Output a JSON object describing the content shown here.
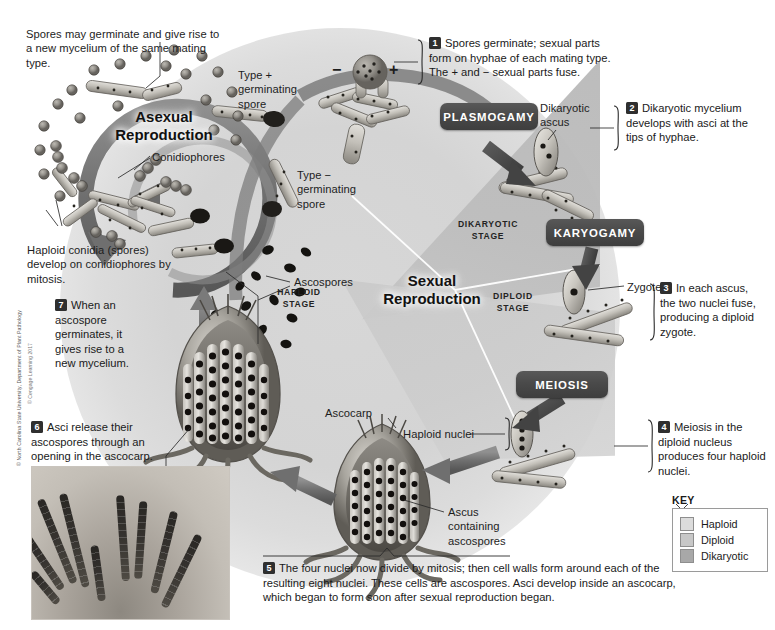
{
  "figure": {
    "asexual_cycle_label": "Asexual\nReproduction",
    "asexual_cycle_line1": "Asexual",
    "asexual_cycle_line2": "Reproduction",
    "sexual_cycle_line1": "Sexual",
    "sexual_cycle_line2": "Reproduction",
    "figure_credit": "© Cengage Learning 2017",
    "photo_credit": "© North Carolina State University, Department of Plant Pathology"
  },
  "stage_labels": {
    "haploid_line1": "HAPLOID",
    "haploid_line2": "STAGE",
    "dikaryotic_line1": "DIKARYOTIC",
    "dikaryotic_line2": "STAGE",
    "diploid_line1": "DIPLOID",
    "diploid_line2": "STAGE"
  },
  "process_boxes": [
    {
      "id": "plasmogamy",
      "label": "PLASMOGAMY"
    },
    {
      "id": "karyogamy",
      "label": "KARYOGAMY"
    },
    {
      "id": "meiosis",
      "label": "MEIOSIS"
    }
  ],
  "numbered_steps": [
    {
      "number": "1",
      "text": "Spores germinate; sexual parts form on hyphae of each mating type. The + and − sexual parts fuse."
    },
    {
      "number": "2",
      "text": "Dikaryotic mycelium develops with asci at the tips of hyphae."
    },
    {
      "number": "3",
      "text": "In each ascus, the two nuclei fuse, producing a diploid zygote."
    },
    {
      "number": "4",
      "text": "Meiosis in the diploid nucleus produces four haploid nuclei."
    },
    {
      "number": "5",
      "text": "The four nuclei now divide by mitosis; then cell walls form around each of the resulting eight nuclei. These cells are ascospores. Asci develop inside an ascocarp, which began to form soon after sexual reproduction began."
    },
    {
      "number": "6",
      "text": "Asci release their ascospores through an opening in the ascocarp."
    },
    {
      "number": "7",
      "text": "When an ascospore germinates, it gives rise to a new mycelium."
    }
  ],
  "annotations": [
    {
      "id": "spores-germinate-note",
      "text": "Spores may germinate and give rise to a new mycelium of the same mating type."
    },
    {
      "id": "type-plus-spore",
      "text": "Type +\ngerminating\nspore",
      "line1": "Type +",
      "line2": "germinating",
      "line3": "spore"
    },
    {
      "id": "type-minus-spore",
      "line1": "Type −",
      "line2": "germinating",
      "line3": "spore"
    },
    {
      "id": "conidiophores",
      "text": "Conidiophores"
    },
    {
      "id": "haploid-conidia",
      "text": "Haploid conidia (spores) develop on conidiophores by mitosis."
    },
    {
      "id": "ascospores",
      "text": "Ascospores"
    },
    {
      "id": "dikaryotic-ascus",
      "line1": "Dikaryotic",
      "line2": "ascus"
    },
    {
      "id": "zygote",
      "text": "Zygote"
    },
    {
      "id": "haploid-nuclei",
      "text": "Haploid nuclei"
    },
    {
      "id": "ascocarp",
      "text": "Ascocarp"
    },
    {
      "id": "ascus-containing-ascospores",
      "line1": "Ascus",
      "line2": "containing",
      "line3": "ascospores"
    },
    {
      "id": "plus-sign",
      "text": "+"
    },
    {
      "id": "minus-sign",
      "text": "−"
    }
  ],
  "key": {
    "title": "KEY",
    "items": [
      {
        "label": "Haploid",
        "color": "#dcdcdc"
      },
      {
        "label": "Diploid",
        "color": "#c8c8c8"
      },
      {
        "label": "Dikaryotic",
        "color": "#a8a8a8"
      }
    ]
  },
  "colors": {
    "process_box": "#4a4a4a",
    "haploid_field": "#dcdcdc",
    "diploid_field": "#c8c8c8",
    "dikaryotic_field": "#a8a8a8",
    "text": "#1d1d1d",
    "page_background": "#ffffff"
  }
}
